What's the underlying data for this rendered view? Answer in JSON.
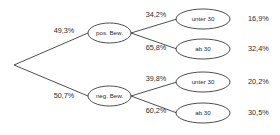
{
  "diagram": {
    "type": "probability-tree",
    "root": {
      "label": ""
    },
    "level1": [
      {
        "id": "pos",
        "node_label": "pos. Bew.",
        "branch_probability": "49,3%"
      },
      {
        "id": "neg",
        "node_label": "neg. Bew.",
        "branch_probability": "50,7%"
      }
    ],
    "level2": [
      {
        "id": "pos-unter30",
        "node_label": "unter 30",
        "branch_probability": "34,2%",
        "result": "16,9%"
      },
      {
        "id": "pos-ab30",
        "node_label": "ab 30",
        "branch_probability": "65,8%",
        "result": "32,4%"
      },
      {
        "id": "neg-unter30",
        "node_label": "unter 30",
        "branch_probability": "39,8%",
        "result": "20,2%"
      },
      {
        "id": "neg-ab30",
        "node_label": "ab 30",
        "branch_probability": "60,2%",
        "result": "30,5%"
      }
    ],
    "colors": {
      "stroke": "#3a3a3a",
      "text": "#2b2b2b",
      "background": "#ffffff"
    }
  }
}
